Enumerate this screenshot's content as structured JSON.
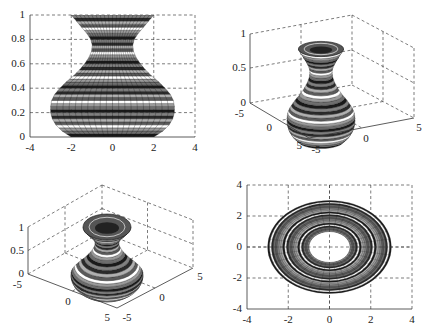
{
  "figure": {
    "band_colors": [
      "#1a1a1a",
      "#6e6e6e",
      "#9a9a9a",
      "#ffffff",
      "#5a5a5a",
      "#b0b0b0",
      "#2a2a2a",
      "#808080"
    ]
  },
  "chart_data": [
    {
      "type": "surface",
      "view": "side (2D, az=0 el=0)",
      "title": "",
      "xlabel": "",
      "ylabel": "",
      "xlim": [
        -4,
        4
      ],
      "ylim": [
        0,
        1
      ],
      "xticks": [
        "-4",
        "-2",
        "0",
        "2",
        "4"
      ],
      "yticks": [
        "0",
        "0.2",
        "0.4",
        "0.6",
        "0.8",
        "1"
      ],
      "grid": true,
      "profile": {
        "z": [
          0,
          0.05,
          0.1,
          0.15,
          0.2,
          0.25,
          0.3,
          0.35,
          0.4,
          0.45,
          0.5,
          0.55,
          0.6,
          0.65,
          0.7,
          0.75,
          0.8,
          0.85,
          0.9,
          0.95,
          1.0
        ],
        "r": [
          2.0,
          2.45,
          2.75,
          2.92,
          3.0,
          3.0,
          2.95,
          2.8,
          2.55,
          2.25,
          1.9,
          1.6,
          1.35,
          1.15,
          1.02,
          0.98,
          1.05,
          1.25,
          1.5,
          1.75,
          2.0
        ]
      }
    },
    {
      "type": "surface3d",
      "view": "3D perspective",
      "xlim": [
        -5,
        5
      ],
      "ylim": [
        -5,
        5
      ],
      "zlim": [
        0,
        1
      ],
      "xticks": [
        "-5",
        "0",
        "5"
      ],
      "yticks": [
        "-5",
        "0",
        "5"
      ],
      "zticks": [
        "0",
        "0.5",
        "1"
      ],
      "grid": true
    },
    {
      "type": "surface3d",
      "view": "3D perspective (higher elevation)",
      "xlim": [
        -5,
        5
      ],
      "ylim": [
        -5,
        5
      ],
      "zlim": [
        0,
        1
      ],
      "xticks": [
        "-5",
        "0",
        "5"
      ],
      "yticks": [
        "-5",
        "0",
        "5"
      ],
      "zticks": [
        "0",
        "0.5",
        "1"
      ],
      "grid": true
    },
    {
      "type": "surface",
      "view": "top (2D, az=0 el=90)",
      "xlim": [
        -4,
        4
      ],
      "ylim": [
        -4,
        4
      ],
      "xticks": [
        "-4",
        "-2",
        "0",
        "2",
        "4"
      ],
      "yticks": [
        "-4",
        "-2",
        "0",
        "2",
        "4"
      ],
      "grid": true,
      "rings": {
        "outer_radius": 3.0,
        "inner_radius": 1.0
      }
    }
  ],
  "plots": {
    "p1": {
      "xticks": [
        "-4",
        "-2",
        "0",
        "2",
        "4"
      ],
      "yticks": [
        "0",
        "0.2",
        "0.4",
        "0.6",
        "0.8",
        "1"
      ]
    },
    "p2": {
      "zticks": [
        "0",
        "0.5",
        "1"
      ],
      "yticks": [
        "-5",
        "0",
        "5"
      ],
      "xticks": [
        "-5",
        "0",
        "5"
      ]
    },
    "p3": {
      "zticks": [
        "0",
        "0.5",
        "1"
      ],
      "yticks": [
        "-5",
        "0",
        "5"
      ],
      "xticks": [
        "-5",
        "0",
        "5"
      ]
    },
    "p4": {
      "xticks": [
        "-4",
        "-2",
        "0",
        "2",
        "4"
      ],
      "yticks": [
        "-4",
        "-2",
        "0",
        "2",
        "4"
      ]
    }
  }
}
